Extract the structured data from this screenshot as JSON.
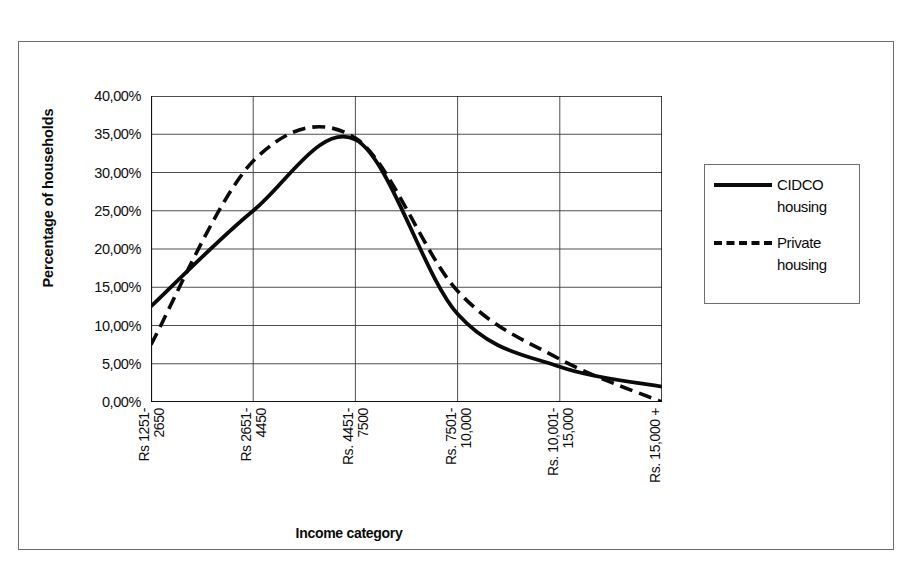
{
  "chart_data": {
    "type": "line",
    "title": "",
    "xlabel": "Income category",
    "ylabel": "Percentage of households",
    "categories": [
      "Rs 1251-\n2650",
      "Rs 2651-\n4450",
      "Rs. 4451-\n7500",
      "Rs. 7501-\n10,000",
      "Rs. 10,001-\n15,000",
      "Rs. 15,000 +"
    ],
    "ylim": [
      0,
      40
    ],
    "yticks": [
      0,
      5,
      10,
      15,
      20,
      25,
      30,
      35,
      40
    ],
    "ytick_labels": [
      "0,00%",
      "5,00%",
      "10,00%",
      "15,00%",
      "20,00%",
      "25,00%",
      "30,00%",
      "35,00%",
      "40,00%"
    ],
    "grid": "horizontal-and-vertical",
    "legend_position": "right",
    "series": [
      {
        "name": "CIDCO housing",
        "style": "solid",
        "color": "#0a0a0a",
        "values": [
          12.5,
          25.0,
          34.3,
          11.5,
          4.6,
          2.0
        ]
      },
      {
        "name": "Private housing",
        "style": "dashed",
        "color": "#0a0a0a",
        "values": [
          7.5,
          31.5,
          34.5,
          14.5,
          5.6,
          0.0
        ]
      }
    ]
  },
  "axis": {
    "y_title": "Percentage of households",
    "x_title": "Income category"
  },
  "legend": {
    "items": [
      {
        "label": "CIDCO\nhousing",
        "style": "solid"
      },
      {
        "label": "Private\nhousing",
        "style": "dashed"
      }
    ]
  }
}
